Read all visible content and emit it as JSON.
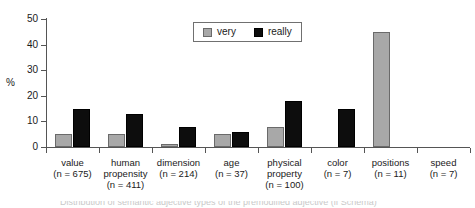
{
  "chart_data": {
    "type": "bar",
    "title": "",
    "xlabel": "",
    "ylabel": "%",
    "ylim": [
      0,
      50
    ],
    "yticks": [
      0,
      10,
      20,
      30,
      40,
      50
    ],
    "grid": false,
    "legend_position": "top-center",
    "categories": [
      "value",
      "human propensity",
      "dimension",
      "age",
      "physical property",
      "color",
      "positions",
      "speed"
    ],
    "category_labels": [
      {
        "name": "value",
        "n": "(n = 675)"
      },
      {
        "name": "human propensity",
        "n": "(n = 411)"
      },
      {
        "name": "dimension",
        "n": "(n = 214)"
      },
      {
        "name": "age",
        "n": "(n = 37)"
      },
      {
        "name": "physical property",
        "n": "(n = 100)"
      },
      {
        "name": "color",
        "n": "(n = 7)"
      },
      {
        "name": "positions",
        "n": "(n = 11)"
      },
      {
        "name": "speed",
        "n": "(n = 7)"
      }
    ],
    "series": [
      {
        "name": "very",
        "color": "#a8a8a8",
        "values": [
          5,
          5,
          1,
          5,
          8,
          0,
          45,
          0
        ]
      },
      {
        "name": "really",
        "color": "#0d0d0d",
        "values": [
          15,
          13,
          8,
          6,
          18,
          15,
          0,
          0
        ]
      }
    ]
  },
  "legend": {
    "entries": [
      {
        "label": "very",
        "swatch": "very-swatch"
      },
      {
        "label": "really",
        "swatch": "really-swatch"
      }
    ]
  },
  "axis": {
    "y_title": "%",
    "y_tick_labels": [
      "50",
      "40",
      "30",
      "20",
      "10",
      "0"
    ]
  },
  "caption": {
    "text": "Distribution of semantic adjective types of the premodified adjective (if Schema)"
  }
}
